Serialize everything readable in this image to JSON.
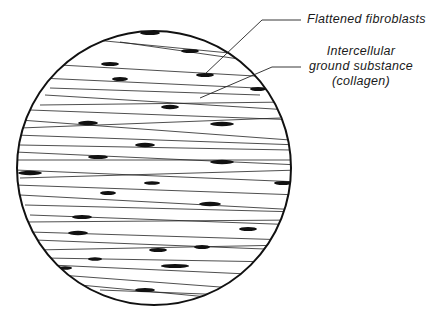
{
  "diagram": {
    "labels": [
      {
        "id": "fibroblasts",
        "text": "Flattened fibroblasts"
      },
      {
        "id": "ground",
        "lines": [
          "Intercellular",
          "ground substance",
          "(collagen)"
        ]
      }
    ],
    "colors": {
      "ink": "#1a1a1a",
      "background": "#ffffff"
    }
  }
}
